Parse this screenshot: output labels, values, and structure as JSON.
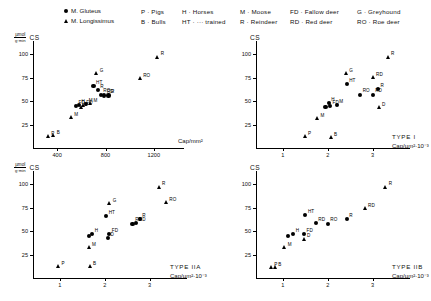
{
  "legend": {
    "symbols": [
      {
        "marker": "circle",
        "label": "M. Gluteus"
      },
      {
        "marker": "triangle",
        "label": "M. Longissimus"
      }
    ],
    "columns": [
      [
        "P · Pigs",
        "B · Bulls"
      ],
      [
        "H · Horses",
        "HT · ··· trained"
      ],
      [
        "M · Moose",
        "R · Reindeer"
      ],
      [
        "FD · Fallow deer",
        "RD · Red deer"
      ],
      [
        "G · Greyhound",
        "RO · Roe deer"
      ]
    ]
  },
  "axes": {
    "ylabel_num": "µmol",
    "ylabel_den": "g·min",
    "ylabel_cs": "CS",
    "cs_only": "CS",
    "yticks": [
      "100",
      "75",
      "50",
      "25"
    ],
    "xticks_count": [
      "400",
      "800",
      "1200"
    ],
    "xticks_area": [
      "1",
      "2",
      "3"
    ],
    "xlabel_count": "Cap/mm²",
    "xlabel_area": "Cap/µm²·10⁻³"
  },
  "chart_data": [
    {
      "id": "panel-top-left",
      "type": "scatter",
      "title": "",
      "panel_label": "",
      "xlabel": "Cap/mm²",
      "ylabel": "µmol/g·min  CS",
      "xlim": [
        200,
        1400
      ],
      "ylim": [
        0,
        110
      ],
      "xticks": [
        400,
        800,
        1200
      ],
      "yticks": [
        25,
        50,
        75,
        100
      ],
      "grid": false,
      "legend_position": "top",
      "series": [
        {
          "name": "M. Gluteus",
          "marker": "circle",
          "points": [
            {
              "label": "FD",
              "x": 555,
              "y": 45
            },
            {
              "label": "H",
              "x": 580,
              "y": 46
            },
            {
              "label": "M",
              "x": 640,
              "y": 47
            },
            {
              "label": "HT",
              "x": 700,
              "y": 66
            },
            {
              "label": "R",
              "x": 735,
              "y": 62
            },
            {
              "label": "RO",
              "x": 760,
              "y": 57
            },
            {
              "label": "RD",
              "x": 790,
              "y": 56
            },
            {
              "label": "R",
              "x": 825,
              "y": 56
            }
          ]
        },
        {
          "name": "M. Longissimus",
          "marker": "triangle",
          "points": [
            {
              "label": "P",
              "x": 330,
              "y": 12
            },
            {
              "label": "B",
              "x": 375,
              "y": 13
            },
            {
              "label": "M",
              "x": 520,
              "y": 32
            },
            {
              "label": "D",
              "x": 600,
              "y": 43
            },
            {
              "label": "FD",
              "x": 620,
              "y": 45
            },
            {
              "label": "M",
              "x": 680,
              "y": 47
            },
            {
              "label": "G",
              "x": 730,
              "y": 79
            },
            {
              "label": "RO",
              "x": 1090,
              "y": 74
            },
            {
              "label": "R",
              "x": 1235,
              "y": 97
            }
          ]
        }
      ]
    },
    {
      "id": "panel-top-right",
      "type": "scatter",
      "title": "",
      "panel_label": "TYPE I",
      "xlabel": "Cap/µm²·10⁻³",
      "ylabel": "CS",
      "xlim": [
        0.4,
        3.7
      ],
      "ylim": [
        0,
        110
      ],
      "xticks": [
        1,
        2,
        3
      ],
      "yticks": [
        25,
        50,
        75,
        100
      ],
      "grid": false,
      "legend_position": "top",
      "series": [
        {
          "name": "M. Gluteus",
          "marker": "circle",
          "points": [
            {
              "label": "",
              "x": 1.95,
              "y": 44
            },
            {
              "label": "H",
              "x": 2.02,
              "y": 48
            },
            {
              "label": "FD",
              "x": 2.05,
              "y": 45
            },
            {
              "label": "M",
              "x": 2.2,
              "y": 46
            },
            {
              "label": "HT",
              "x": 2.42,
              "y": 68
            },
            {
              "label": "RO",
              "x": 2.72,
              "y": 57
            },
            {
              "label": "RD",
              "x": 3.0,
              "y": 57
            },
            {
              "label": "R",
              "x": 3.12,
              "y": 63
            }
          ]
        },
        {
          "name": "M. Longissimus",
          "marker": "triangle",
          "points": [
            {
              "label": "P",
              "x": 1.5,
              "y": 12
            },
            {
              "label": "B",
              "x": 2.08,
              "y": 11
            },
            {
              "label": "M",
              "x": 1.78,
              "y": 31
            },
            {
              "label": "G",
              "x": 2.42,
              "y": 79
            },
            {
              "label": "RD",
              "x": 3.02,
              "y": 75
            },
            {
              "label": "D",
              "x": 3.15,
              "y": 43
            },
            {
              "label": "R",
              "x": 3.35,
              "y": 97
            }
          ]
        }
      ]
    },
    {
      "id": "panel-bottom-left",
      "type": "scatter",
      "title": "",
      "panel_label": "TYPE IIA",
      "xlabel": "Cap/µm²·10⁻³",
      "ylabel": "µmol/g·min  CS",
      "xlim": [
        0.4,
        3.7
      ],
      "ylim": [
        0,
        110
      ],
      "xticks": [
        1,
        2,
        3
      ],
      "yticks": [
        25,
        50,
        75,
        100
      ],
      "grid": false,
      "legend_position": "top",
      "series": [
        {
          "name": "M. Gluteus",
          "marker": "circle",
          "points": [
            {
              "label": "",
              "x": 1.64,
              "y": 45
            },
            {
              "label": "H",
              "x": 1.72,
              "y": 47
            },
            {
              "label": "D",
              "x": 2.07,
              "y": 43
            },
            {
              "label": "FD",
              "x": 2.1,
              "y": 47
            },
            {
              "label": "HT",
              "x": 2.03,
              "y": 66
            },
            {
              "label": "RD",
              "x": 2.62,
              "y": 58
            },
            {
              "label": "RD",
              "x": 2.7,
              "y": 59
            },
            {
              "label": "R",
              "x": 2.78,
              "y": 63
            }
          ]
        },
        {
          "name": "M. Longissimus",
          "marker": "triangle",
          "points": [
            {
              "label": "P",
              "x": 0.98,
              "y": 12
            },
            {
              "label": "B",
              "x": 1.68,
              "y": 12
            },
            {
              "label": "M",
              "x": 1.66,
              "y": 32
            },
            {
              "label": "G",
              "x": 2.12,
              "y": 79
            },
            {
              "label": "R",
              "x": 3.22,
              "y": 97
            },
            {
              "label": "RO",
              "x": 3.38,
              "y": 80
            }
          ]
        }
      ]
    },
    {
      "id": "panel-bottom-right",
      "type": "scatter",
      "title": "",
      "panel_label": "TYPE IIB",
      "xlabel": "Cap/µm²·10⁻³",
      "ylabel": "CS",
      "xlim": [
        0.4,
        3.7
      ],
      "ylim": [
        0,
        110
      ],
      "xticks": [
        1,
        2,
        3
      ],
      "yticks": [
        25,
        50,
        75,
        100
      ],
      "grid": false,
      "legend_position": "top",
      "series": [
        {
          "name": "M. Gluteus",
          "marker": "circle",
          "points": [
            {
              "label": "",
              "x": 1.11,
              "y": 45
            },
            {
              "label": "H",
              "x": 1.23,
              "y": 47
            },
            {
              "label": "FD",
              "x": 1.47,
              "y": 47
            },
            {
              "label": "HT",
              "x": 1.5,
              "y": 67
            },
            {
              "label": "RD",
              "x": 1.73,
              "y": 59
            },
            {
              "label": "RO",
              "x": 2.0,
              "y": 58
            },
            {
              "label": "R",
              "x": 2.42,
              "y": 63
            }
          ]
        },
        {
          "name": "M. Longissimus",
          "marker": "triangle",
          "points": [
            {
              "label": "P",
              "x": 0.75,
              "y": 11
            },
            {
              "label": "B",
              "x": 0.84,
              "y": 11
            },
            {
              "label": "M",
              "x": 1.05,
              "y": 32
            },
            {
              "label": "D",
              "x": 1.48,
              "y": 41
            },
            {
              "label": "RD",
              "x": 2.84,
              "y": 74
            },
            {
              "label": "R",
              "x": 3.3,
              "y": 97
            }
          ]
        }
      ]
    }
  ]
}
